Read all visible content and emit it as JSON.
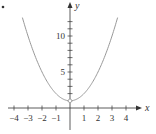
{
  "chart_data": {
    "type": "line",
    "title": "",
    "xlabel": "x",
    "ylabel": "y",
    "function": "y = x^2 + 1",
    "xlim": [
      -4.5,
      5
    ],
    "ylim": [
      -2,
      13
    ],
    "x_ticks": [
      -4,
      -3,
      -2,
      -1,
      1,
      2,
      3,
      4
    ],
    "x_tick_labels": [
      "−4",
      "−3",
      "−2",
      "−1",
      "1",
      "2",
      "3",
      "4"
    ],
    "y_ticks": [
      1,
      2,
      3,
      4,
      5,
      6,
      7,
      8,
      9,
      10,
      11,
      12
    ],
    "y_tick_labels": [
      {
        "value": 5,
        "label": "5"
      },
      {
        "value": 10,
        "label": "10"
      }
    ],
    "series": [
      {
        "name": "parabola",
        "x": [
          -3.4,
          -3,
          -2.5,
          -2,
          -1.5,
          -1,
          -0.5,
          0,
          0.5,
          1,
          1.5,
          2,
          2.5,
          3,
          3.4
        ],
        "y": [
          12.56,
          10,
          7.25,
          5,
          3.25,
          2,
          1.25,
          1,
          1.25,
          2,
          3.25,
          5,
          7.25,
          10,
          12.56
        ],
        "color": "#999999"
      }
    ],
    "annotations": [
      {
        "type": "open-circle",
        "x": 0,
        "y": 1
      }
    ],
    "grid": false,
    "legend": null
  },
  "colors": {
    "axis": "#333333",
    "curve": "#999999"
  }
}
